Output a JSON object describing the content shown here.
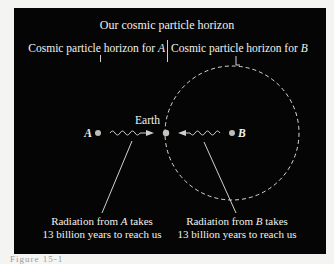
{
  "diagram": {
    "labels": {
      "our_horizon": "Our cosmic particle horizon",
      "horizon_a_prefix": "Cosmic particle horizon for ",
      "horizon_a_var": "A",
      "horizon_b_prefix": "Cosmic particle horizon for ",
      "horizon_b_var": "B",
      "earth": "Earth",
      "point_a": "A",
      "point_b": "B",
      "rad_a_line1_pre": "Radiation from ",
      "rad_a_line1_var": "A",
      "rad_a_line1_post": " takes",
      "rad_a_line2": "13 billion years to reach us",
      "rad_b_line1_pre": "Radiation from ",
      "rad_b_line1_var": "B",
      "rad_b_line1_post": " takes",
      "rad_b_line2": "13 billion years to reach us"
    },
    "caption": "Figure 15-1"
  },
  "colors": {
    "background": "#050505",
    "text": "#f2f2ec",
    "point": "#bdbdb8"
  }
}
